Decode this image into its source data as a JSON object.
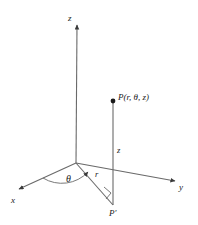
{
  "figure": {
    "type": "cylindrical-coordinates-diagram",
    "stroke_color": "#555555",
    "label_color": "#1a1a1a",
    "background": "#ffffff",
    "width": 198,
    "height": 225
  },
  "axes": [
    {
      "id": "z",
      "label": "z",
      "label_x": 68,
      "label_y": 15,
      "from": [
        76,
        163
      ],
      "to": [
        77,
        24
      ]
    },
    {
      "id": "x",
      "label": "x",
      "label_x": 11,
      "label_y": 197,
      "from": [
        76,
        163
      ],
      "to": [
        18,
        190
      ]
    },
    {
      "id": "y",
      "label": "y",
      "label_x": 179,
      "label_y": 184,
      "from": [
        76,
        163
      ],
      "to": [
        176,
        181
      ]
    }
  ],
  "points": [
    {
      "id": "P",
      "label": "P(r, θ, z)",
      "label_x": 118,
      "label_y": 93,
      "x": 113,
      "y": 101
    },
    {
      "id": "Pprime",
      "label": "P′",
      "label_x": 110,
      "label_y": 210,
      "x": 113,
      "y": 205
    }
  ],
  "segments": [
    {
      "id": "z-height",
      "label": "z",
      "label_x": 117,
      "label_y": 146,
      "from": [
        113,
        101
      ],
      "to": [
        113,
        205
      ]
    },
    {
      "id": "r-radial",
      "label": "r",
      "label_x": 95,
      "label_y": 170,
      "from": [
        76,
        163
      ],
      "to": [
        113,
        205
      ]
    }
  ],
  "angles": [
    {
      "id": "theta",
      "label": "θ",
      "label_x": 66,
      "label_y": 174
    }
  ],
  "markers": [
    {
      "id": "right-angle",
      "x": 106,
      "y": 189
    }
  ]
}
